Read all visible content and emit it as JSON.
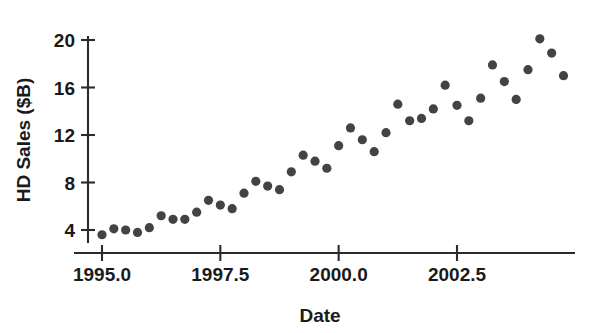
{
  "chart_data": {
    "type": "scatter",
    "title": "",
    "xlabel": "Date",
    "ylabel": "HD Sales ($B)",
    "xlim": [
      1994.75,
      1994.75
    ],
    "ylim": [
      2.0,
      21.5
    ],
    "grid": false,
    "legend": null,
    "point_color": "#434343",
    "axis_color": "#2b2b2b",
    "background": "#ffffff",
    "xticks": [
      {
        "value": 1995.0,
        "label": "1995.0"
      },
      {
        "value": 1997.5,
        "label": "1997.5"
      },
      {
        "value": 2000.0,
        "label": "2000.0"
      },
      {
        "value": 2002.5,
        "label": "2002.5"
      }
    ],
    "yticks": [
      {
        "value": 4,
        "label": "4"
      },
      {
        "value": 8,
        "label": "8"
      },
      {
        "value": 12,
        "label": "12"
      },
      {
        "value": 16,
        "label": "16"
      },
      {
        "value": 20,
        "label": "20"
      }
    ],
    "x": [
      1995.0,
      1995.25,
      1995.5,
      1995.75,
      1996.0,
      1996.25,
      1996.5,
      1996.75,
      1997.0,
      1997.25,
      1997.5,
      1997.75,
      1998.0,
      1998.25,
      1998.5,
      1998.75,
      1999.0,
      1999.25,
      1999.5,
      1999.75,
      2000.0,
      2000.25,
      2000.5,
      2000.75,
      2001.0,
      2001.25,
      2001.5,
      2001.75,
      2002.0,
      2002.25,
      2002.5,
      2002.75,
      2003.0,
      2003.25,
      2003.5,
      2003.75,
      2004.0,
      2004.25
    ],
    "y": [
      3.6,
      4.1,
      4.0,
      3.8,
      4.2,
      5.2,
      4.9,
      4.9,
      5.5,
      6.5,
      6.1,
      5.8,
      7.1,
      8.1,
      7.7,
      7.4,
      8.9,
      10.3,
      9.8,
      9.2,
      11.1,
      12.6,
      11.6,
      10.6,
      12.2,
      14.6,
      13.2,
      13.4,
      14.2,
      16.2,
      14.5,
      13.2,
      15.1,
      17.9,
      16.5,
      15.0,
      17.5,
      20.1
    ],
    "extra_points": [
      {
        "x": 2004.5,
        "y": 18.9
      },
      {
        "x": 2004.75,
        "y": 17.0
      }
    ],
    "n_points": 40,
    "series_name": "HD Sales"
  }
}
